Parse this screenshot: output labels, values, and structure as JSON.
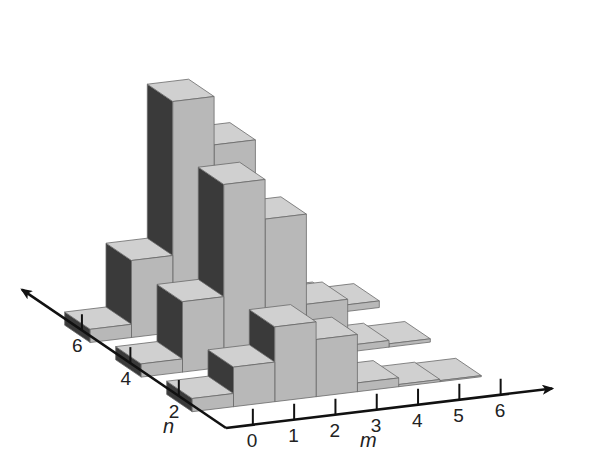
{
  "chart_data": {
    "type": "bar3d",
    "title": "",
    "xlabel": "m",
    "ylabel": "n",
    "zlabel": "",
    "x_ticks": [
      "0",
      "1",
      "2",
      "3",
      "4",
      "5",
      "6"
    ],
    "y_ticks": [
      "2",
      "4",
      "6"
    ],
    "grid": false,
    "legend": "none",
    "series": [
      {
        "name": "n=6",
        "n": 6,
        "values": [
          0.6,
          3.5,
          10.5,
          8.3,
          3.4,
          0.6,
          0.3
        ]
      },
      {
        "name": "n=4",
        "n": 4,
        "values": [
          0.6,
          3.2,
          8.3,
          6.5,
          2.4,
          0.3,
          0.15
        ]
      },
      {
        "name": "n=2",
        "n": 2,
        "values": [
          0.6,
          1.8,
          3.4,
          2.6,
          0.4,
          0.1,
          0.05
        ]
      }
    ],
    "colors": {
      "front_face": "#b8b8b8",
      "top_face": "#d0d0d0",
      "side_face": "#3a3a3a",
      "edge": "#6a6a6a",
      "axis": "#111111"
    }
  }
}
